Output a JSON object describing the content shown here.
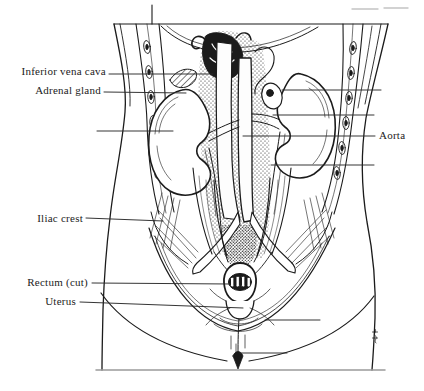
{
  "annotations": {
    "inferior_vena_cava": {
      "text": "Inferior vena cava"
    },
    "adrenal_gland": {
      "text": "Adrenal gland"
    },
    "aorta": {
      "text": "Aorta"
    },
    "iliac_crest": {
      "text": "Iliac crest"
    },
    "rectum_cut": {
      "text": "Rectum (cut)"
    },
    "uterus": {
      "text": "Uterus"
    }
  },
  "colors": {
    "ink": "#1b1b1b",
    "paper": "#ffffff",
    "leader_line": "#2a2a2a",
    "faint_scan_mark": "#c4c4c4"
  }
}
